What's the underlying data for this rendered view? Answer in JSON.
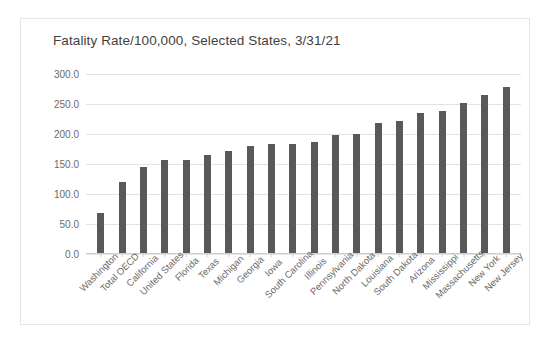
{
  "chart_data": {
    "type": "bar",
    "title": "Fatality Rate/100,000, Selected States, 3/31/21",
    "xlabel": "",
    "ylabel": "",
    "ylim": [
      0,
      300
    ],
    "ytick_step": 50,
    "ytick_labels": [
      "300.0",
      "250.0",
      "200.0",
      "150.0",
      "100.0",
      "50.0",
      "0.0"
    ],
    "grid": true,
    "legend": "none",
    "bar_color": "#595959",
    "gridline_color": "#e3e3e3",
    "categories": [
      "Washington",
      "Total OECD",
      "California",
      "United States",
      "Florida",
      "Texas",
      "Michigan",
      "Georgia",
      "Iowa",
      "South Carolina",
      "Illinois",
      "Pennsylvania",
      "North Dakota",
      "Louisiana",
      "South Dakota",
      "Arizona",
      "Mississippi",
      "Massachusetts",
      "New York",
      "New Jersey"
    ],
    "values": [
      68,
      120,
      145,
      157,
      157,
      165,
      172,
      180,
      183,
      183,
      187,
      198,
      200,
      218,
      222,
      235,
      238,
      252,
      265,
      278
    ]
  }
}
